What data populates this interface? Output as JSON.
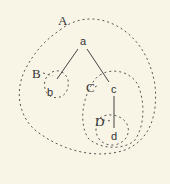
{
  "diagram": {
    "colors": {
      "background": "#f8f5e6",
      "stroke": "#555555",
      "text": "#333333"
    },
    "nodes": [
      {
        "id": "a",
        "label": "a"
      },
      {
        "id": "b",
        "label": "b"
      },
      {
        "id": "c",
        "label": "c"
      },
      {
        "id": "d",
        "label": "d"
      }
    ],
    "edges": [
      {
        "from": "a",
        "to": "b"
      },
      {
        "from": "a",
        "to": "c"
      },
      {
        "from": "c",
        "to": "d"
      }
    ],
    "regions": [
      {
        "id": "A",
        "label": "A",
        "encloses": [
          "a",
          "b",
          "c",
          "d"
        ]
      },
      {
        "id": "B",
        "label": "B",
        "encloses": [
          "b"
        ]
      },
      {
        "id": "C",
        "label": "C",
        "encloses": [
          "c",
          "d"
        ]
      },
      {
        "id": "D",
        "label": "D",
        "encloses": [
          "d"
        ]
      }
    ]
  }
}
